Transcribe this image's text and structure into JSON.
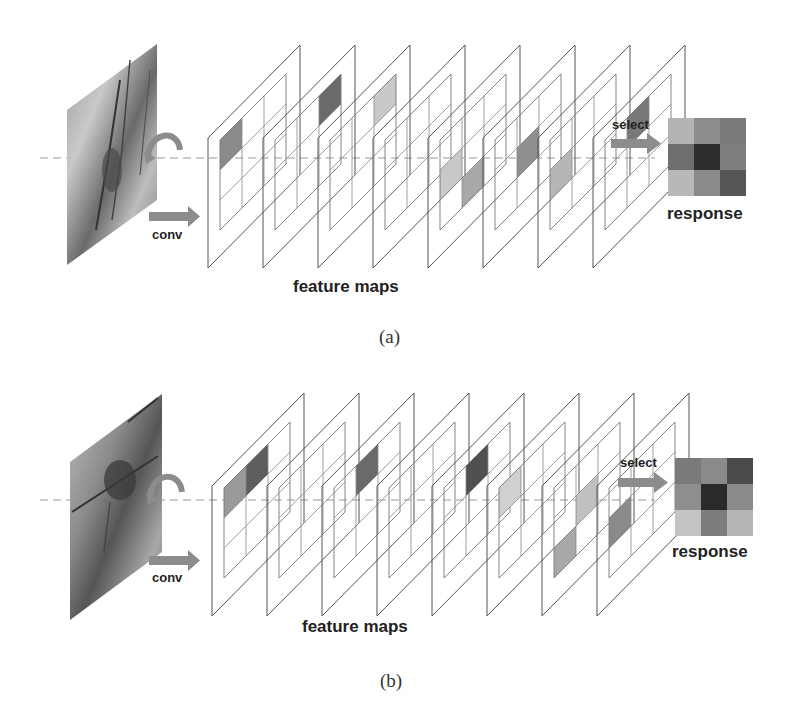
{
  "figure": {
    "panels": [
      {
        "id": "a",
        "caption": "(a)",
        "input_label": "conv",
        "feature_maps_label": "feature maps",
        "select_label": "select",
        "response_label": "response",
        "feature_map_count": 8,
        "response_grid": [
          [
            "#b4b4b4",
            "#8c8c8c",
            "#7a7a7a"
          ],
          [
            "#6e6e6e",
            "#2e2e2e",
            "#7e7e7e"
          ],
          [
            "#b8b8b8",
            "#8a8a8a",
            "#555555"
          ]
        ],
        "highlighted_cells": [
          {
            "map": 0,
            "row": 0,
            "col": 0,
            "shade": "#8a8a8a"
          },
          {
            "map": 1,
            "row": 0,
            "col": 2,
            "shade": "#6a6a6a"
          },
          {
            "map": 2,
            "row": 0,
            "col": 2,
            "shade": "#c8c8c8"
          },
          {
            "map": 4,
            "row": 1,
            "col": 0,
            "shade": "#c8c8c8"
          },
          {
            "map": 4,
            "row": 2,
            "col": 1,
            "shade": "#a8a8a8"
          },
          {
            "map": 5,
            "row": 1,
            "col": 1,
            "shade": "#8e8e8e"
          },
          {
            "map": 6,
            "row": 1,
            "col": 0,
            "shade": "#b6b6b6"
          },
          {
            "map": 7,
            "row": 0,
            "col": 1,
            "shade": "#787878"
          }
        ]
      },
      {
        "id": "b",
        "caption": "(b)",
        "input_label": "conv",
        "feature_maps_label": "feature maps",
        "select_label": "select",
        "response_label": "response",
        "feature_map_count": 8,
        "response_grid": [
          [
            "#7a7a7a",
            "#8a8a8a",
            "#4a4a4a"
          ],
          [
            "#8e8e8e",
            "#2a2a2a",
            "#8a8a8a"
          ],
          [
            "#c4c4c4",
            "#7c7c7c",
            "#b6b6b6"
          ]
        ],
        "highlighted_cells": [
          {
            "map": 0,
            "row": 0,
            "col": 0,
            "shade": "#9a9a9a"
          },
          {
            "map": 0,
            "row": 0,
            "col": 1,
            "shade": "#5e5e5e"
          },
          {
            "map": 2,
            "row": 0,
            "col": 1,
            "shade": "#6a6a6a"
          },
          {
            "map": 4,
            "row": 0,
            "col": 1,
            "shade": "#505050"
          },
          {
            "map": 5,
            "row": 0,
            "col": 0,
            "shade": "#d0d0d0"
          },
          {
            "map": 6,
            "row": 1,
            "col": 1,
            "shade": "#c0c0c0"
          },
          {
            "map": 6,
            "row": 2,
            "col": 0,
            "shade": "#a8a8a8"
          },
          {
            "map": 7,
            "row": 1,
            "col": 0,
            "shade": "#8a8a8a"
          }
        ]
      }
    ]
  },
  "colors": {
    "arrow": "#8c8c8c",
    "outline": "#555555",
    "grid": "#888888",
    "text": "#222222"
  }
}
